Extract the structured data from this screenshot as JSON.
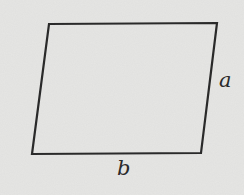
{
  "diagram": {
    "shape": "parallelogram",
    "vertices": {
      "top_left": [
        49,
        24
      ],
      "top_right": [
        217,
        23
      ],
      "bottom_right": [
        201,
        153
      ],
      "bottom_left": [
        32,
        154
      ]
    },
    "colors": {
      "background": "#e6e6e4",
      "stroke": "#2a2a2a"
    },
    "labels": {
      "side_right": "a",
      "side_bottom": "b"
    }
  }
}
